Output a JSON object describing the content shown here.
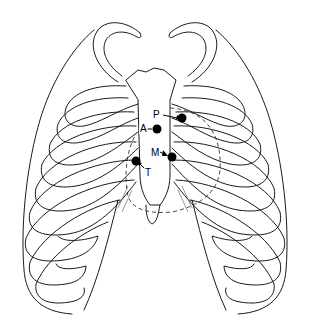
{
  "figure": {
    "colors": {
      "line": "#1a1a1a",
      "dot": "#000000",
      "background": "#ffffff"
    },
    "points": [
      {
        "id": "P",
        "label": "P",
        "label_pos": [
          152,
          110
        ],
        "dot_pos": [
          182,
          118
        ],
        "arrow": "right"
      },
      {
        "id": "A",
        "label": "A",
        "label_pos": [
          139,
          124
        ],
        "dot_pos": [
          157,
          129
        ],
        "arrow": "left"
      },
      {
        "id": "M",
        "label": "M",
        "label_pos": [
          150,
          148
        ],
        "dot_pos": [
          172,
          157
        ],
        "arrow": "left"
      },
      {
        "id": "T",
        "label": "T",
        "label_pos": [
          144,
          168
        ],
        "dot_pos": [
          136,
          161
        ],
        "arrow": "up-left"
      }
    ]
  }
}
